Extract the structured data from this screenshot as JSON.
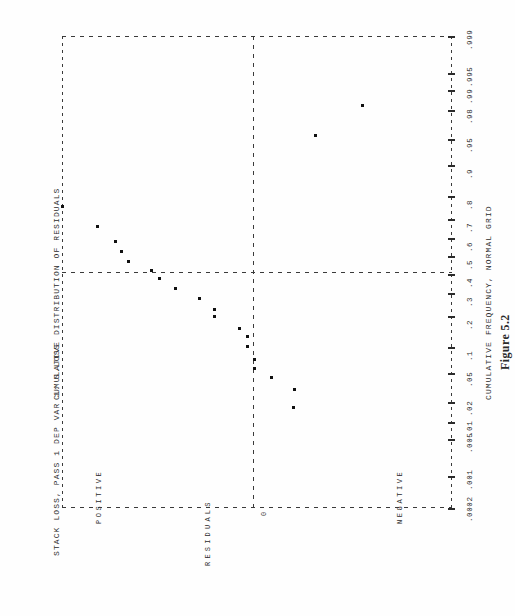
{
  "header": {
    "title": "STACK LOSS, PASS 1 DEP VAR 1: S.LOSS",
    "top_axis_title": "CUMULATIVE DISTRIBUTION OF RESIDUALS",
    "bottom_axis_title": "CUMULATIVE FREQUENCY, NORMAL GRID",
    "figure_caption": "Figure 5.2"
  },
  "labels": {
    "residual_axis": "RESIDUALS",
    "positive": "POSITIVE",
    "negative": "NEGATIVE",
    "zero": "0"
  },
  "chart_data": {
    "type": "scatter",
    "title": "CUMULATIVE DISTRIBUTION OF RESIDUALS",
    "subtitle": "STACK LOSS, PASS 1 DEP VAR 1: S.LOSS",
    "caption": "Figure 5.2",
    "xlabel": "CUMULATIVE FREQUENCY, NORMAL GRID",
    "ylabel": "RESIDUALS",
    "orientation": "landscape-plot-on-portrait-page (rotated 90 degrees counter-clockwise)",
    "grid": "dashed normal-probability grid",
    "legend": "none",
    "x_axis": {
      "name": "CUMULATIVE FREQUENCY, NORMAL GRID",
      "scale": "normal probability",
      "tick_labels": [
        ".0002",
        ".001",
        ".005",
        ".01",
        ".02",
        ".05",
        ".1",
        ".2",
        ".3",
        ".4",
        ".5",
        ".6",
        ".7",
        ".8",
        ".9",
        ".95",
        ".98",
        ".99",
        ".995",
        ".999"
      ],
      "tick_values": [
        0.0002,
        0.001,
        0.005,
        0.01,
        0.02,
        0.05,
        0.1,
        0.2,
        0.3,
        0.4,
        0.5,
        0.6,
        0.7,
        0.8,
        0.9,
        0.95,
        0.98,
        0.99,
        0.995,
        0.999
      ],
      "reference_line_at": 0.5
    },
    "y_axis": {
      "name": "RESIDUALS",
      "categories": [
        "POSITIVE",
        "0",
        "NEGATIVE"
      ],
      "zero_reference_line": true,
      "tick_labels": []
    },
    "n_points": 21,
    "points": [
      {
        "cum_freq": 0.976,
        "residual": 5.7
      },
      {
        "cum_freq": 0.929,
        "residual": 4.55
      },
      {
        "cum_freq": 0.881,
        "residual": 3.2
      },
      {
        "cum_freq": 0.833,
        "residual": 2.8
      },
      {
        "cum_freq": 0.786,
        "residual": 2.35
      },
      {
        "cum_freq": 0.738,
        "residual": 1.7
      },
      {
        "cum_freq": 0.69,
        "residual": 1.3
      },
      {
        "cum_freq": 0.643,
        "residual": 0.9
      },
      {
        "cum_freq": 0.595,
        "residual": 0.25
      },
      {
        "cum_freq": 0.548,
        "residual": -0.05
      },
      {
        "cum_freq": 0.5,
        "residual": -0.1
      },
      {
        "cum_freq": 0.452,
        "residual": -0.55
      },
      {
        "cum_freq": 0.405,
        "residual": -0.85
      },
      {
        "cum_freq": 0.357,
        "residual": -1.05
      },
      {
        "cum_freq": 0.31,
        "residual": -1.35
      },
      {
        "cum_freq": 0.262,
        "residual": -1.55
      },
      {
        "cum_freq": 0.214,
        "residual": -1.9
      },
      {
        "cum_freq": 0.167,
        "residual": -2.45
      },
      {
        "cum_freq": 0.119,
        "residual": -2.9
      },
      {
        "cum_freq": 0.071,
        "residual": -3.3
      },
      {
        "cum_freq": 0.024,
        "residual": -7.2
      }
    ],
    "plot_pixels": {
      "note": "marker positions as laid out in the recreated figure, in plot-area coordinates",
      "markers": [
        {
          "x": 0.0,
          "y": 170.0
        },
        {
          "x": 35.5,
          "y": 190.0
        },
        {
          "x": 53.0,
          "y": 205.5
        },
        {
          "x": 59.0,
          "y": 215.5
        },
        {
          "x": 66.5,
          "y": 225.0
        },
        {
          "x": 89.5,
          "y": 234.0
        },
        {
          "x": 97.0,
          "y": 242.5
        },
        {
          "x": 113.0,
          "y": 252.5
        },
        {
          "x": 137.0,
          "y": 262.5
        },
        {
          "x": 152.0,
          "y": 273.0
        },
        {
          "x": 152.5,
          "y": 280.0
        },
        {
          "x": 177.0,
          "y": 292.0
        },
        {
          "x": 185.0,
          "y": 300.0
        },
        {
          "x": 185.0,
          "y": 310.0
        },
        {
          "x": 192.0,
          "y": 323.0
        },
        {
          "x": 192.5,
          "y": 332.0
        },
        {
          "x": 209.0,
          "y": 341.0
        },
        {
          "x": 232.5,
          "y": 353.0
        },
        {
          "x": 231.0,
          "y": 371.0
        },
        {
          "x": 253.0,
          "y": 99.0
        },
        {
          "x": 300.0,
          "y": 69.0
        }
      ]
    }
  }
}
